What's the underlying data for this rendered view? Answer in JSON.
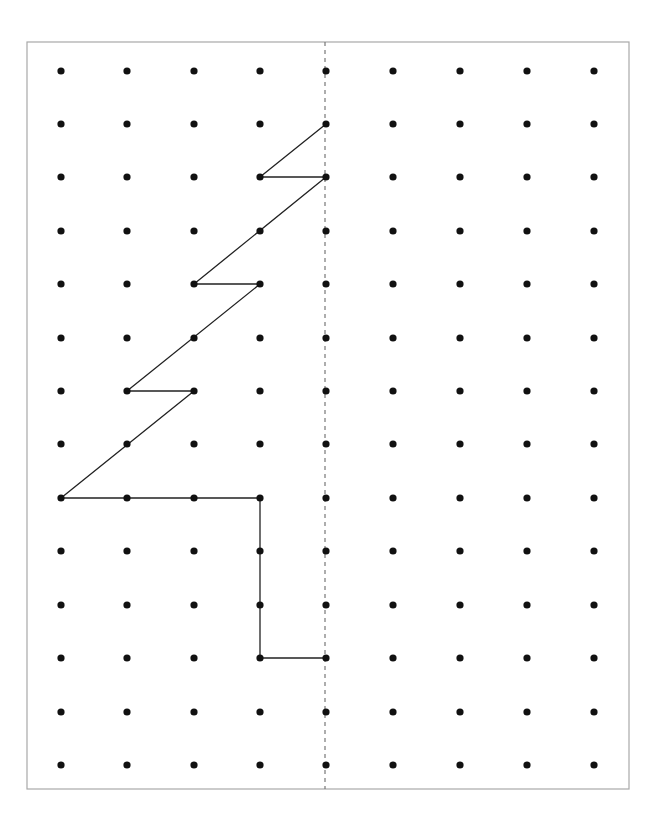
{
  "diagram": {
    "frame": {
      "x": 27,
      "y": 42,
      "width": 602,
      "height": 747,
      "stroke": "#a8a8a8"
    },
    "grid": {
      "columns_x": [
        61,
        127,
        194,
        260,
        326,
        393,
        460,
        527,
        594
      ],
      "rows_y": [
        71,
        124,
        177,
        231,
        284,
        338,
        391,
        444,
        498,
        551,
        605,
        658,
        712,
        765
      ],
      "dot_radius": 3.6,
      "dot_color": "#111111"
    },
    "symmetry_line": {
      "type": "dashed",
      "x": 325,
      "y1": 42,
      "y2": 789,
      "color": "#777777",
      "dash": "4,4"
    },
    "shape": {
      "description": "Left half of a tree drawn on dot grid, to be reflected across the dashed mirror line",
      "stroke": "#222222",
      "stroke_width": 1.3,
      "vertices_grid": [
        [
          4,
          1
        ],
        [
          3,
          2
        ],
        [
          4,
          2
        ],
        [
          2,
          4
        ],
        [
          3,
          4
        ],
        [
          1,
          6
        ],
        [
          2,
          6
        ],
        [
          0,
          8
        ],
        [
          3,
          8
        ],
        [
          3,
          11
        ],
        [
          4,
          11
        ]
      ]
    }
  }
}
